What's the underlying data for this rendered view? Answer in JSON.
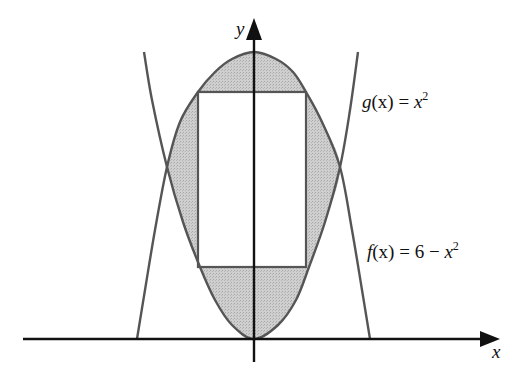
{
  "diagram": {
    "axes": {
      "x_label": "x",
      "y_label": "y",
      "origin_px": [
        254,
        339
      ],
      "x_axis_px": {
        "from": 23,
        "to": 500
      },
      "y_axis_px": {
        "from": 362,
        "to": 18
      },
      "color": "#111111"
    },
    "curves": [
      {
        "id": "f",
        "label_name": "f",
        "label_arg": "(x)",
        "label_eq": " = 6 − ",
        "label_var": "x",
        "label_exp": "2",
        "expression": "f(x) = 6 − x²",
        "label_pos_px": [
          370,
          252
        ],
        "points_px": [
          [
            137,
            339
          ],
          [
            145,
            290
          ],
          [
            155,
            230
          ],
          [
            167,
            167
          ],
          [
            180,
            122
          ],
          [
            198,
            92
          ],
          [
            215,
            72
          ],
          [
            232,
            59
          ],
          [
            254,
            52
          ],
          [
            276,
            59
          ],
          [
            293,
            72
          ],
          [
            306,
            92
          ],
          [
            322,
            122
          ],
          [
            340,
            167
          ],
          [
            352,
            230
          ],
          [
            362,
            290
          ],
          [
            370,
            339
          ]
        ],
        "color": "#555555"
      },
      {
        "id": "g",
        "label_name": "g",
        "label_arg": "(x)",
        "label_eq": " = ",
        "label_var": "x",
        "label_exp": "2",
        "expression": "g(x) = x²",
        "label_pos_px": [
          362,
          102
        ],
        "points_px": [
          [
            144,
            52
          ],
          [
            152,
            100
          ],
          [
            167,
            167
          ],
          [
            183,
            222
          ],
          [
            200,
            267
          ],
          [
            215,
            300
          ],
          [
            232,
            325
          ],
          [
            254,
            339
          ],
          [
            278,
            325
          ],
          [
            296,
            300
          ],
          [
            309,
            267
          ],
          [
            325,
            222
          ],
          [
            340,
            167
          ],
          [
            350,
            110
          ],
          [
            358,
            52
          ]
        ],
        "color": "#555555"
      }
    ],
    "rectangle": {
      "x_px": 198,
      "y_px": 92,
      "width_px": 108,
      "height_px": 175,
      "fill": "#ffffff",
      "stroke": "#555555"
    },
    "region_fill": "#c8c8c8"
  }
}
